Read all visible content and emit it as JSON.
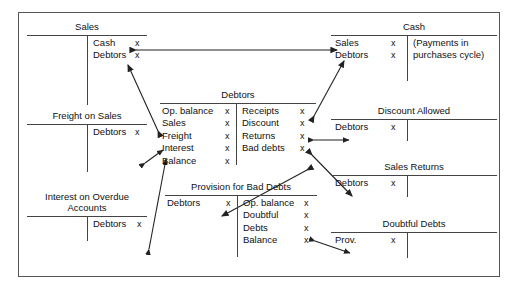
{
  "diagram": {
    "amount_symbol": "x",
    "line_color": "#444444",
    "text_color": "#111111",
    "border_color": "#555555"
  },
  "accounts": [
    {
      "id": "sales",
      "name": "Sales",
      "debit_entries": [],
      "credit_entries": [
        {
          "label": "Cash",
          "amount": "x"
        },
        {
          "label": "Debtors",
          "amount": "x"
        }
      ]
    },
    {
      "id": "freight-on-sales",
      "name": "Freight on Sales",
      "debit_entries": [],
      "credit_entries": [
        {
          "label": "Debtors",
          "amount": "x"
        }
      ]
    },
    {
      "id": "interest-on-overdue-accounts",
      "name": "Interest on Overdue\nAccounts",
      "debit_entries": [],
      "credit_entries": [
        {
          "label": "Debtors",
          "amount": "x"
        }
      ]
    },
    {
      "id": "debtors",
      "name": "Debtors",
      "debit_entries": [
        {
          "label": "Op. balance",
          "amount": "x"
        },
        {
          "label": "Sales",
          "amount": "x"
        },
        {
          "label": "Freight",
          "amount": "x"
        },
        {
          "label": "Interest",
          "amount": "x"
        },
        {
          "label": "Balance",
          "amount": "x"
        }
      ],
      "credit_entries": [
        {
          "label": "Receipts",
          "amount": "x"
        },
        {
          "label": "Discount",
          "amount": "x"
        },
        {
          "label": "Returns",
          "amount": "x"
        },
        {
          "label": "Bad debts",
          "amount": "x"
        }
      ]
    },
    {
      "id": "provision-for-bad-debts",
      "name": "Provision for Bad Debts",
      "debit_entries": [
        {
          "label": "Debtors",
          "amount": "x"
        }
      ],
      "credit_entries": [
        {
          "label": "Op. balance",
          "amount": "x"
        },
        {
          "label": "Doubtful",
          "amount": "x"
        },
        {
          "label": "Debts",
          "amount": "x"
        },
        {
          "label": "Balance",
          "amount": "x"
        }
      ]
    },
    {
      "id": "cash",
      "name": "Cash",
      "debit_entries": [
        {
          "label": "Sales",
          "amount": "x"
        },
        {
          "label": "Debtors",
          "amount": "x"
        }
      ],
      "credit_entries": [],
      "credit_note": "(Payments in\npurchases cycle)"
    },
    {
      "id": "discount-allowed",
      "name": "Discount Allowed",
      "debit_entries": [
        {
          "label": "Debtors",
          "amount": "x"
        }
      ],
      "credit_entries": []
    },
    {
      "id": "sales-returns",
      "name": "Sales Returns",
      "debit_entries": [
        {
          "label": "Debtors",
          "amount": "x"
        }
      ],
      "credit_entries": []
    },
    {
      "id": "doubtful-debts",
      "name": "Doubtful Debts",
      "debit_entries": [
        {
          "label": "Prov.",
          "amount": "x"
        }
      ],
      "credit_entries": []
    }
  ],
  "connections": [
    {
      "id": "sales-cash",
      "from": "sales.credit.cash",
      "to": "cash.debit.sales",
      "style": "double-headed"
    },
    {
      "id": "debtors-sales",
      "from": "debtors.debit.sales",
      "to": "sales.credit.debtors",
      "style": "double-headed"
    },
    {
      "id": "freight-debtors",
      "from": "freight-on-sales.credit.debtors",
      "to": "debtors.debit.freight",
      "style": "double-headed"
    },
    {
      "id": "interest-debtors",
      "from": "interest-on-overdue-accounts.credit.debtors",
      "to": "debtors.debit.interest",
      "style": "double-headed"
    },
    {
      "id": "debtors-receipts-cash",
      "from": "debtors.credit.receipts",
      "to": "cash.debit.debtors",
      "style": "double-headed"
    },
    {
      "id": "debtors-discount",
      "from": "debtors.credit.discount",
      "to": "discount-allowed.debit.debtors",
      "style": "double-headed"
    },
    {
      "id": "debtors-returns",
      "from": "debtors.credit.returns",
      "to": "sales-returns.debit.debtors",
      "style": "double-headed"
    },
    {
      "id": "debtors-bad-debts",
      "from": "debtors.credit.bad-debts",
      "to": "provision-for-bad-debts.debit.debtors",
      "style": "double-headed"
    },
    {
      "id": "provision-doubtful",
      "from": "provision-for-bad-debts.credit.debts",
      "to": "doubtful-debts.debit.prov",
      "style": "double-headed"
    }
  ]
}
